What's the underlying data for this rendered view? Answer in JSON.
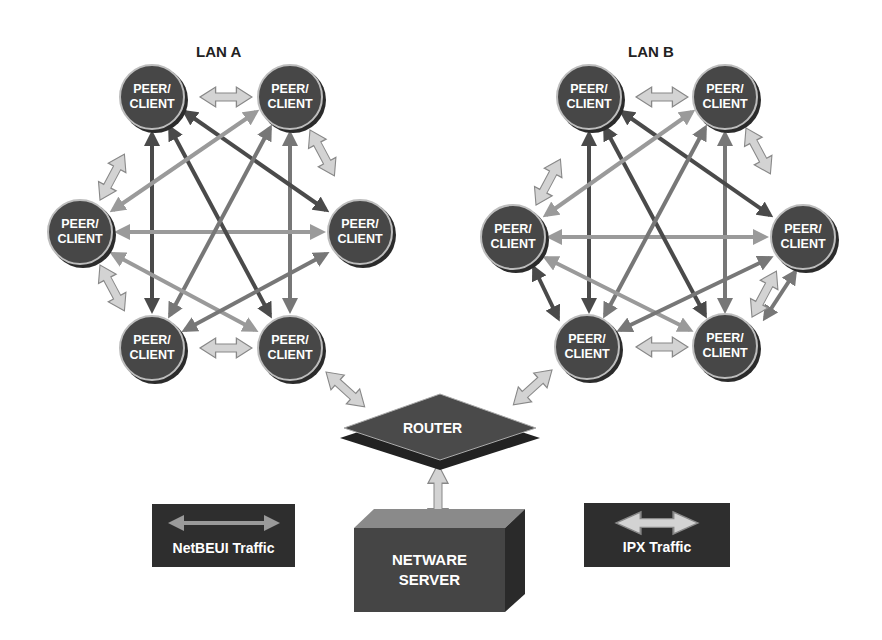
{
  "lans": [
    {
      "title": "LAN A",
      "nodes": [
        {
          "label": "PEER/\nCLIENT"
        },
        {
          "label": "PEER/\nCLIENT"
        },
        {
          "label": "PEER/\nCLIENT"
        },
        {
          "label": "PEER/\nCLIENT"
        },
        {
          "label": "PEER/\nCLIENT"
        },
        {
          "label": "PEER/\nCLIENT"
        }
      ]
    },
    {
      "title": "LAN B",
      "nodes": [
        {
          "label": "PEER/\nCLIENT"
        },
        {
          "label": "PEER/\nCLIENT"
        },
        {
          "label": "PEER/\nCLIENT"
        },
        {
          "label": "PEER/\nCLIENT"
        },
        {
          "label": "PEER/\nCLIENT"
        },
        {
          "label": "PEER/\nCLIENT"
        }
      ]
    }
  ],
  "node_text": {
    "line1": "PEER/",
    "line2": "CLIENT"
  },
  "router": {
    "label": "ROUTER"
  },
  "server": {
    "line1": "NETWARE",
    "line2": "SERVER"
  },
  "legend": {
    "netbeui": {
      "label": "NetBEUI Traffic"
    },
    "ipx": {
      "label": "IPX Traffic"
    }
  },
  "colors": {
    "node": "#474747",
    "ipx_arrow": "#d0d0d0",
    "netbeui_arrow_dark": "#4a4a4a",
    "netbeui_arrow_mid": "#7a7a7a",
    "netbeui_arrow_light": "#9a9a9a"
  }
}
